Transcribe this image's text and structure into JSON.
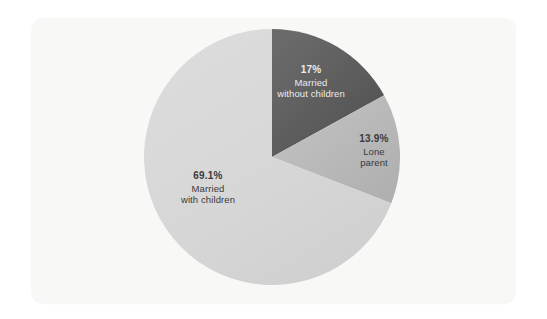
{
  "card": {
    "background_color": "#f8f8f6"
  },
  "chart_data": {
    "type": "pie",
    "title": "",
    "subtitle": "",
    "xlabel": "",
    "ylabel": "",
    "legend_position": "none",
    "grid": false,
    "start_angle_deg": 0,
    "direction": "clockwise",
    "categories": [
      "Married without children",
      "Lone parent",
      "Married with children"
    ],
    "values": [
      17,
      13.9,
      69.1
    ],
    "value_labels": [
      "17%",
      "13.9%",
      "69.1%"
    ],
    "colors": [
      "#5e5e5e",
      "#b8b8b8",
      "#d6d6d6"
    ],
    "slices": [
      {
        "name": "married-without-children",
        "percent_label": "17%",
        "value": 17,
        "desc_lines": [
          "Married",
          "without children"
        ],
        "color": "#5e5e5e",
        "label_color": "#ececec"
      },
      {
        "name": "lone-parent",
        "percent_label": "13.9%",
        "value": 13.9,
        "desc_lines": [
          "Lone",
          "parent"
        ],
        "color": "#b8b8b8",
        "label_color": "#3a3a3a"
      },
      {
        "name": "married-with-children",
        "percent_label": "69.1%",
        "value": 69.1,
        "desc_lines": [
          "Married",
          "with children"
        ],
        "color": "#d6d6d6",
        "label_color": "#3a3a3a"
      }
    ]
  }
}
